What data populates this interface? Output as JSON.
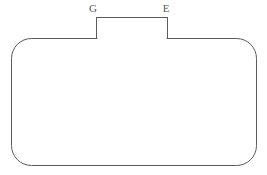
{
  "figure": {
    "background_color": "#ffffff",
    "stroke_color": "#5a5a5a",
    "stroke_width": 1,
    "fill_color": "none",
    "body": {
      "shape": "rounded-rectangle",
      "x": 11,
      "y": 38,
      "width": 246,
      "height": 128,
      "corner_radius": 20
    },
    "handle": {
      "shape": "rectangle",
      "x": 96,
      "y": 17,
      "width": 72,
      "height": 21
    },
    "labels": [
      {
        "id": "label-g",
        "text": "G",
        "x": 93,
        "y": 12,
        "anchor": "middle",
        "color": "#5a5a5a",
        "font_size": 11
      },
      {
        "id": "label-e",
        "text": "E",
        "x": 166,
        "y": 12,
        "anchor": "middle",
        "color": "#5a5a5a",
        "font_size": 11
      }
    ]
  }
}
